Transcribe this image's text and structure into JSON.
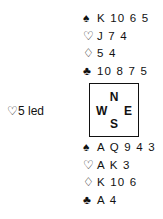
{
  "lead": {
    "suit_symbol": "♡",
    "text": "5 led"
  },
  "compass": {
    "north": "N",
    "south": "S",
    "west": "W",
    "east": "E"
  },
  "north": {
    "spades": {
      "symbol": "♠",
      "cards": "K 10 6 5"
    },
    "hearts": {
      "symbol": "♡",
      "cards": "J 7 4"
    },
    "diamonds": {
      "symbol": "♢",
      "cards": "5 4"
    },
    "clubs": {
      "symbol": "♣",
      "cards": "10 8 7 5"
    }
  },
  "south": {
    "spades": {
      "symbol": "♠",
      "cards": "A Q 9 4 3"
    },
    "hearts": {
      "symbol": "♡",
      "cards": "A K 3"
    },
    "diamonds": {
      "symbol": "♢",
      "cards": "K 10 6"
    },
    "clubs": {
      "symbol": "♣",
      "cards": "A 4"
    }
  }
}
